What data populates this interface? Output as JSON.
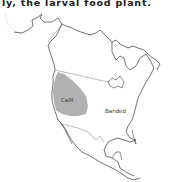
{
  "page": {
    "caption_fragment": "ly, the larval food plant."
  },
  "map": {
    "region": "North America",
    "shaded_region_color": "#a8a8a8",
    "outline_color": "#3a3a3a",
    "labels": {
      "calif": "Calif.",
      "banded": "Banded"
    }
  }
}
